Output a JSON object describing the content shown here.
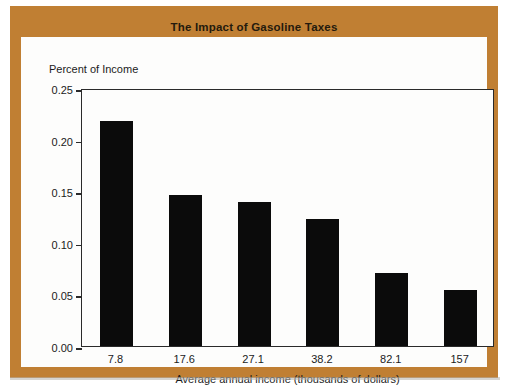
{
  "figure": {
    "title": "The Impact of Gasoline Taxes",
    "frame_color": "#c07f33",
    "panel_color": "#fdfdfc",
    "bar_color": "#0b0b0b",
    "axis_color": "#2a2a2a"
  },
  "chart_data": {
    "type": "bar",
    "title": "The Impact of Gasoline Taxes",
    "categories": [
      "7.8",
      "17.6",
      "27.1",
      "38.2",
      "82.1",
      "157"
    ],
    "values": [
      0.218,
      0.146,
      0.14,
      0.123,
      0.071,
      0.054
    ],
    "xlabel": "Average annual income (thousands of dollars)",
    "ylabel": "Percent of Income",
    "ylim": [
      0.0,
      0.25
    ],
    "yticks": [
      "0.00",
      "0.05",
      "0.10",
      "0.15",
      "0.20",
      "0.25"
    ],
    "ytick_values": [
      0.0,
      0.05,
      0.1,
      0.15,
      0.2,
      0.25
    ],
    "grid": false,
    "legend": null
  }
}
